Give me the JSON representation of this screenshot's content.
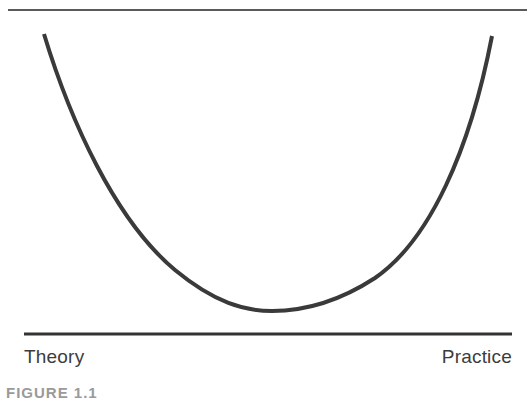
{
  "figure": {
    "left_label": "Theory",
    "right_label": "Practice",
    "caption": "FIGURE 1.1"
  },
  "style": {
    "curve_color": "#3a3a3a",
    "top_line_color": "#5a5a5a",
    "bottom_line_color": "#333333",
    "text_color": "#3c3c3c"
  },
  "geometry": {
    "top_line": {
      "x1": 8,
      "y1": 10,
      "x2": 527,
      "y2": 10
    },
    "bottom_line": {
      "x1": 24,
      "y1": 334,
      "x2": 512,
      "y2": 334
    },
    "curve": {
      "start": [
        44,
        34
      ],
      "minimum": [
        270,
        310
      ],
      "end": [
        492,
        36
      ]
    }
  }
}
